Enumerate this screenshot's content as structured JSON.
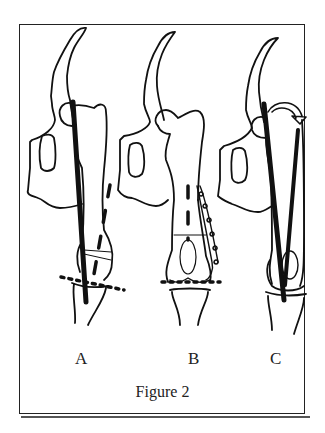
{
  "figure": {
    "caption": "Figure 2",
    "panels": [
      {
        "label": "A"
      },
      {
        "label": "B"
      },
      {
        "label": "C"
      }
    ],
    "colors": {
      "line": "#111111",
      "frame": "#222222",
      "background": "#ffffff"
    }
  }
}
